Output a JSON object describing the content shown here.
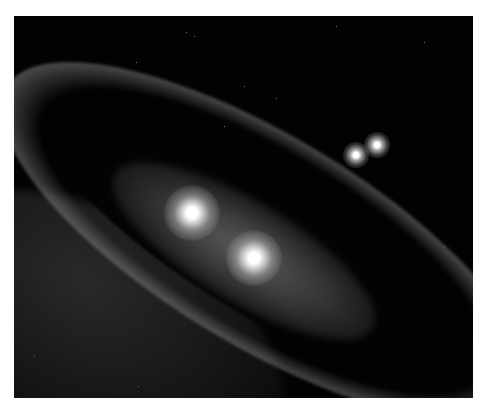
{
  "image": {
    "description": "Artist illustration of a multi-star system: two bright central stars inside a tilted dusty debris ring, with a distant pair of stars in the upper right",
    "palette": {
      "background": "#020202",
      "ring": "#bdbdbd",
      "star_core": "#ffffff",
      "border": "#ffffff"
    },
    "elements": {
      "central_stars": [
        {
          "name": "central-star-a",
          "x": 192,
          "y": 213
        },
        {
          "name": "central-star-b",
          "x": 254,
          "y": 258
        }
      ],
      "distant_stars": [
        {
          "name": "distant-star-a",
          "x": 356,
          "y": 155
        },
        {
          "name": "distant-star-b",
          "x": 377,
          "y": 145
        }
      ]
    }
  }
}
